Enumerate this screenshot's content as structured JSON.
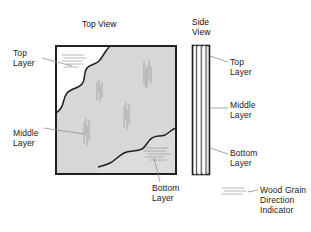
{
  "diagram": {
    "titles": {
      "top_view": "Top View",
      "side_view_line1": "Side",
      "side_view_line2": "View"
    },
    "left_labels": {
      "top_layer_line1": "Top",
      "top_layer_line2": "Layer",
      "middle_layer_line1": "Middle",
      "middle_layer_line2": "Layer"
    },
    "right_labels": {
      "top_layer_line1": "Top",
      "top_layer_line2": "Layer",
      "middle_layer_line1": "Middle",
      "middle_layer_line2": "Layer",
      "bottom_layer_line1": "Bottom",
      "bottom_layer_line2": "Layer"
    },
    "bottom_label": {
      "line1": "Bottom",
      "line2": "Layer"
    },
    "legend": {
      "line1": "Wood Grain",
      "line2": "Direction",
      "line3": "Indicator"
    },
    "colors": {
      "outline": "#231f20",
      "middle_layer_fill": "#d7d7d7",
      "bottom_layer_fill": "#dcdcdc",
      "top_layer_fill": "#ffffff",
      "grain_stroke": "#9a9a9a",
      "leader_line": "#8a8a8a",
      "text": "#1a1a1a",
      "background": "#ffffff"
    },
    "icons": {
      "grain_indicator": "wood-grain-icon",
      "leader": "leader-line-icon"
    }
  }
}
